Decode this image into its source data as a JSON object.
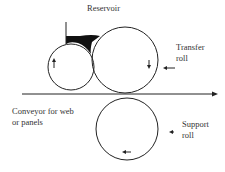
{
  "labels": {
    "reservoir": "Reservoir",
    "transfer_roll_line1": "Transfer",
    "transfer_roll_line2": "roll",
    "conveyor_line1": "Conveyor for web",
    "conveyor_line2": "or panels",
    "support_roll_line1": "Support",
    "support_roll_line2": "roll"
  },
  "colors": {
    "stroke": "#222222",
    "fill_reservoir": "#111111",
    "background": "#ffffff"
  }
}
